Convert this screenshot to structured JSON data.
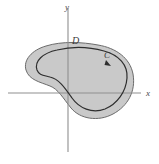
{
  "figure": {
    "type": "math-diagram",
    "background_color": "#ffffff",
    "axes": {
      "name": "cartesian-axes",
      "color": "#8f8f8f",
      "stroke_width": 1.1,
      "x_axis": {
        "label": "x",
        "label_x": 146,
        "label_y": 96,
        "y_position": 93,
        "x_start": 8,
        "x_end": 141
      },
      "y_axis": {
        "label": "y",
        "label_x": 65,
        "label_y": 10,
        "x_position": 68,
        "y_start": 8,
        "y_end": 152
      }
    },
    "region": {
      "name": "region-D",
      "label": "D",
      "label_x": 72,
      "label_y": 44,
      "fill_color": "#c9c9c9",
      "stroke_color": "#6b6b6b",
      "stroke_width": 1.0,
      "outer_path": "M 26 70 C 23 60 32 50 46 46 C 62 41 82 42 98 45 C 116 48 130 58 133 74 C 136 91 128 106 113 114 C 98 122 80 119 71 108 C 63 98 58 89 50 86 C 40 82 29 80 26 70 Z"
    },
    "curve": {
      "name": "curve-C",
      "label": "C",
      "label_x": 104,
      "label_y": 58,
      "stroke_color": "#2e2e2e",
      "stroke_width": 1.2,
      "orientation": "counterclockwise",
      "arrow_x": 108,
      "arrow_y": 64,
      "path": "M 37 70 C 34 61 43 53 57 50 C 73 46 90 47 104 51 C 119 55 128 65 127 78 C 126 92 117 104 105 109 C 92 114 79 108 72 98 C 65 88 59 79 50 77 C 42 75 39 75 37 70 Z"
    }
  }
}
